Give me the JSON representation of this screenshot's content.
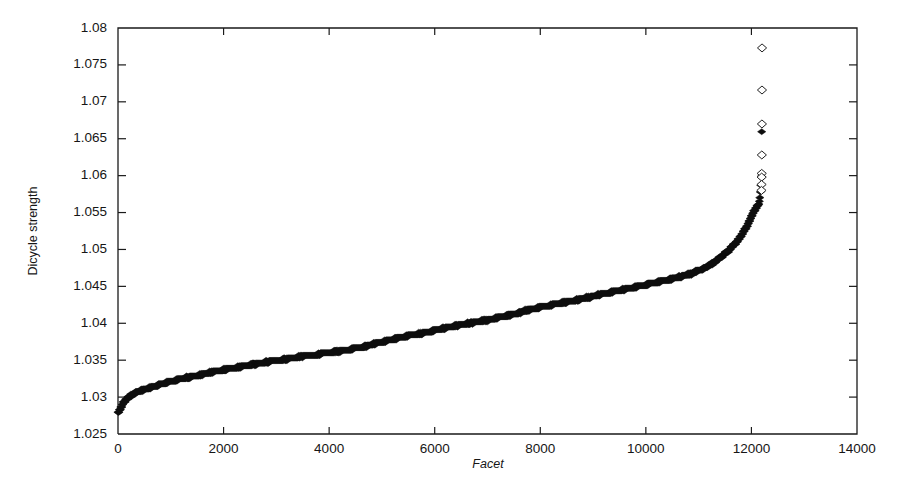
{
  "figure": {
    "width": 902,
    "height": 484,
    "background": "#ffffff",
    "marker_color": "#0d0d0d"
  },
  "axes": {
    "x_title": "Facet",
    "y_title": "Dicycle strength",
    "x_ticklabels": [
      "0",
      "2000",
      "4000",
      "6000",
      "8000",
      "10000",
      "12000",
      "14000"
    ],
    "y_ticklabels": [
      "1.025",
      "1.03",
      "1.035",
      "1.04",
      "1.045",
      "1.05",
      "1.055",
      "1.06",
      "1.065",
      "1.07",
      "1.075",
      "1.08"
    ]
  },
  "chart_data": {
    "type": "scatter",
    "title": "",
    "xlabel": "Facet",
    "ylabel": "Dicycle strength",
    "xlim": [
      0,
      14000
    ],
    "ylim": [
      1.025,
      1.08
    ],
    "xticks": [
      0,
      2000,
      4000,
      6000,
      8000,
      10000,
      12000,
      14000
    ],
    "yticks": [
      1.025,
      1.03,
      1.035,
      1.04,
      1.045,
      1.05,
      1.055,
      1.06,
      1.065,
      1.07,
      1.075,
      1.08
    ],
    "grid": false,
    "legend": null,
    "marker": "diamond",
    "n_points": 12200,
    "series": [
      {
        "name": "Dicycle strength",
        "x": [
          0,
          50,
          110,
          180,
          260,
          350,
          450,
          560,
          690,
          830,
          980,
          1150,
          1330,
          1520,
          1720,
          1930,
          2150,
          2380,
          2620,
          2870,
          3130,
          3400,
          3680,
          3970,
          4270,
          4580,
          4900,
          5230,
          5570,
          5920,
          6280,
          6650,
          7030,
          7420,
          7820,
          8230,
          8650,
          9080,
          9520,
          9970,
          10430,
          10900,
          11200,
          11400,
          11560,
          11690,
          11800,
          11890,
          11960,
          12010,
          12050,
          12080,
          12105,
          12125,
          12140,
          12152,
          12162,
          12170,
          12177,
          12183,
          12188,
          12192,
          12196,
          12199
        ],
        "y": [
          1.0278,
          1.0285,
          1.0293,
          1.0299,
          1.0303,
          1.0306,
          1.0309,
          1.0312,
          1.0315,
          1.0318,
          1.0321,
          1.0324,
          1.0327,
          1.033,
          1.0333,
          1.0336,
          1.0339,
          1.0342,
          1.0345,
          1.0348,
          1.0351,
          1.0354,
          1.0357,
          1.036,
          1.0363,
          1.0367,
          1.0373,
          1.0379,
          1.0384,
          1.0389,
          1.0395,
          1.04,
          1.0405,
          1.0411,
          1.0419,
          1.0425,
          1.0431,
          1.0438,
          1.0445,
          1.0452,
          1.0459,
          1.0468,
          1.0478,
          1.0488,
          1.0498,
          1.0508,
          1.0518,
          1.0528,
          1.0538,
          1.0546,
          1.0552,
          1.0556,
          1.0558,
          1.056,
          1.0561,
          1.0566,
          1.0572,
          1.058,
          1.0587,
          1.0596,
          1.0601,
          1.0628,
          1.067,
          1.0716
        ]
      }
    ],
    "outliers": [
      {
        "x": 12201,
        "y": 1.0773
      },
      {
        "x": 12200,
        "y": 1.0716
      },
      {
        "x": 12199,
        "y": 1.067
      },
      {
        "x": 12197,
        "y": 1.0628
      },
      {
        "x": 12195,
        "y": 1.0603
      },
      {
        "x": 12194,
        "y": 1.0598
      },
      {
        "x": 12192,
        "y": 1.0588
      },
      {
        "x": 12190,
        "y": 1.058
      }
    ]
  }
}
